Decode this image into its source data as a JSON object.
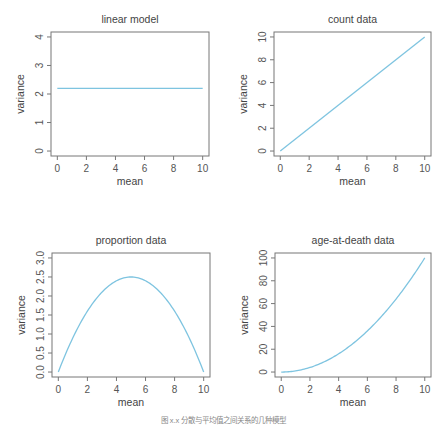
{
  "line_color": "#7ec4e0",
  "caption": "图 x.x  分散与平均值之间关系的几种模型",
  "chart_data": [
    {
      "type": "line",
      "title": "linear model",
      "xlabel": "mean",
      "ylabel": "variance",
      "xlim": [
        0,
        10
      ],
      "ylim": [
        0,
        4
      ],
      "xticks": [
        "0",
        "2",
        "4",
        "6",
        "8",
        "10"
      ],
      "yticks": [
        "0",
        "1",
        "2",
        "3",
        "4"
      ],
      "x": [
        0,
        10
      ],
      "y": [
        2.2,
        2.2
      ],
      "grid": false
    },
    {
      "type": "line",
      "title": "count data",
      "xlabel": "mean",
      "ylabel": "variance",
      "xlim": [
        0,
        10
      ],
      "ylim": [
        0,
        10
      ],
      "xticks": [
        "0",
        "2",
        "4",
        "6",
        "8",
        "10"
      ],
      "yticks": [
        "0",
        "2",
        "4",
        "6",
        "8",
        "10"
      ],
      "x": [
        0,
        10
      ],
      "y": [
        0,
        10
      ],
      "grid": false
    },
    {
      "type": "line",
      "title": "proportion data",
      "xlabel": "mean",
      "ylabel": "variance",
      "xlim": [
        0,
        10
      ],
      "ylim": [
        0,
        3
      ],
      "xticks": [
        "0",
        "2",
        "4",
        "6",
        "8",
        "10"
      ],
      "yticks": [
        "0.0",
        "0.5",
        "1.0",
        "1.5",
        "2.0",
        "2.5",
        "3.0"
      ],
      "x": [
        0,
        1,
        2,
        3,
        4,
        5,
        6,
        7,
        8,
        9,
        10
      ],
      "y": [
        0,
        0.9,
        1.6,
        2.1,
        2.4,
        2.5,
        2.4,
        2.1,
        1.6,
        0.9,
        0
      ],
      "grid": false
    },
    {
      "type": "line",
      "title": "age-at-death data",
      "xlabel": "mean",
      "ylabel": "variance",
      "xlim": [
        0,
        10
      ],
      "ylim": [
        0,
        100
      ],
      "xticks": [
        "0",
        "2",
        "4",
        "6",
        "8",
        "10"
      ],
      "yticks": [
        "0",
        "20",
        "40",
        "60",
        "80",
        "100"
      ],
      "x": [
        0,
        1,
        2,
        3,
        4,
        5,
        6,
        7,
        8,
        9,
        10
      ],
      "y": [
        0,
        1,
        4,
        9,
        16,
        25,
        36,
        49,
        64,
        81,
        100
      ],
      "grid": false
    }
  ]
}
